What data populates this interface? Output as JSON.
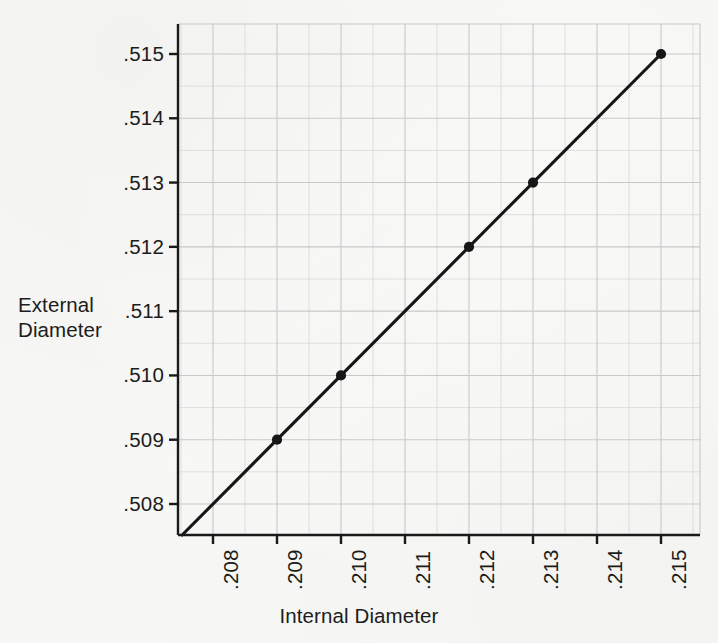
{
  "figure": {
    "background_color": "#f7f7f5",
    "ink_color": "#1a1a1a",
    "grid_color": "#c9c9c9",
    "minor_grid_color": "#dedede"
  },
  "axis_titles": {
    "y_line1": "External",
    "y_line2": "Diameter",
    "x": "Internal Diameter"
  },
  "chart_data": {
    "type": "line",
    "title": "",
    "subtitle": "",
    "xlabel": "Internal Diameter",
    "ylabel": "External Diameter",
    "xlim": [
      0.2075,
      0.21575
    ],
    "ylim": [
      0.50755,
      0.51547
    ],
    "x_tick_labels": [
      ".208",
      ".209",
      ".210",
      ".211",
      ".212",
      ".213",
      ".214",
      ".215"
    ],
    "x_tick_values": [
      0.208,
      0.209,
      0.21,
      0.211,
      0.212,
      0.213,
      0.214,
      0.215
    ],
    "y_tick_labels": [
      ".508",
      ".509",
      ".510",
      ".511",
      ".512",
      ".513",
      ".514",
      ".515"
    ],
    "y_tick_values": [
      0.508,
      0.509,
      0.51,
      0.511,
      0.512,
      0.513,
      0.514,
      0.515
    ],
    "grid": true,
    "minor_grid": true,
    "legend": "none",
    "x_tick_label_rotation": -90,
    "series": [
      {
        "name": "External vs Internal Diameter",
        "marker": "filled-circle",
        "line_color": "#161616",
        "line_width": 3.1,
        "x": [
          0.209,
          0.21,
          0.212,
          0.213,
          0.215
        ],
        "y": [
          0.509,
          0.51,
          0.512,
          0.513,
          0.515
        ],
        "points": [
          {
            "x": 0.209,
            "y": 0.509,
            "marker": true
          },
          {
            "x": 0.21,
            "y": 0.51,
            "marker": true
          },
          {
            "x": 0.212,
            "y": 0.512,
            "marker": true
          },
          {
            "x": 0.213,
            "y": 0.513,
            "marker": true
          },
          {
            "x": 0.215,
            "y": 0.515,
            "marker": true
          }
        ],
        "line_extends_to_axes_origin": true,
        "relation": "external = internal + 0.300"
      }
    ]
  },
  "geometry": {
    "plot_left": 178,
    "plot_right": 700,
    "plot_top": 24,
    "plot_bottom": 535,
    "x_px": [
      213,
      277,
      341,
      405,
      469,
      533,
      597,
      661
    ],
    "y_px": [
      504,
      438,
      373,
      309,
      244,
      180,
      119,
      54
    ]
  }
}
